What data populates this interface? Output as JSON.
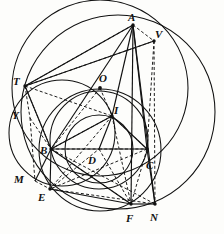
{
  "figure": {
    "kind": "euclidean-geometry-diagram",
    "background_color": "#fdfdfb",
    "stroke_color": "#111111",
    "dot_color": "#111111"
  },
  "labels": [
    {
      "id": "A",
      "text": "A",
      "x": 128,
      "y": 12
    },
    {
      "id": "V",
      "text": "V",
      "x": 155,
      "y": 29
    },
    {
      "id": "T",
      "text": "T",
      "x": 13,
      "y": 76
    },
    {
      "id": "O",
      "text": "O",
      "x": 99,
      "y": 73
    },
    {
      "id": "Y",
      "text": "Y",
      "x": 12,
      "y": 110
    },
    {
      "id": "I",
      "text": "I",
      "x": 114,
      "y": 105
    },
    {
      "id": "B",
      "text": "B",
      "x": 40,
      "y": 145
    },
    {
      "id": "D",
      "text": "D",
      "x": 88,
      "y": 155
    },
    {
      "id": "C",
      "text": "C",
      "x": 146,
      "y": 160
    },
    {
      "id": "M",
      "text": "M",
      "x": 14,
      "y": 174
    },
    {
      "id": "E",
      "text": "E",
      "x": 38,
      "y": 192
    },
    {
      "id": "F",
      "text": "F",
      "x": 126,
      "y": 213
    },
    {
      "id": "N",
      "text": "N",
      "x": 150,
      "y": 212
    }
  ],
  "points": [
    {
      "id": "A",
      "x": 133,
      "y": 25,
      "marked": true
    },
    {
      "id": "V",
      "x": 154,
      "y": 41,
      "marked": true
    },
    {
      "id": "T",
      "x": 25,
      "y": 86,
      "marked": true
    },
    {
      "id": "O",
      "x": 100,
      "y": 88,
      "marked": true
    },
    {
      "id": "Y",
      "x": 30,
      "y": 118,
      "marked": false
    },
    {
      "id": "I",
      "x": 112,
      "y": 116,
      "marked": true
    },
    {
      "id": "B",
      "x": 51,
      "y": 149,
      "marked": true
    },
    {
      "id": "D",
      "x": 99,
      "y": 149,
      "marked": false
    },
    {
      "id": "C",
      "x": 147,
      "y": 149,
      "marked": true
    },
    {
      "id": "M",
      "x": 35,
      "y": 181,
      "marked": false
    },
    {
      "id": "E",
      "x": 50,
      "y": 189,
      "marked": true
    },
    {
      "id": "F",
      "x": 131,
      "y": 204,
      "marked": true
    },
    {
      "id": "N",
      "x": 155,
      "y": 204,
      "marked": true
    }
  ],
  "circles": [
    {
      "id": "circumcircle-ABC",
      "cx": 100,
      "cy": 88,
      "r": 88,
      "style": "solid"
    },
    {
      "id": "circle-right-large",
      "cx": 118,
      "cy": 112,
      "r": 97,
      "style": "solid"
    },
    {
      "id": "circle-left-TBME",
      "cx": 62,
      "cy": 133,
      "r": 53,
      "style": "solid"
    },
    {
      "id": "circle-BIC-mid",
      "cx": 99,
      "cy": 140,
      "r": 49,
      "style": "solid"
    },
    {
      "id": "incircle-BDC",
      "cx": 99,
      "cy": 149,
      "r": 34,
      "style": "solid"
    },
    {
      "id": "circle-lower-EFN",
      "cx": 100,
      "cy": 150,
      "r": 61,
      "style": "solid"
    }
  ],
  "solid_segments": [
    [
      "A",
      "B"
    ],
    [
      "A",
      "C"
    ],
    [
      "A",
      "I"
    ],
    [
      "A",
      "F"
    ],
    [
      "B",
      "C"
    ],
    [
      "B",
      "E"
    ],
    [
      "B",
      "M"
    ],
    [
      "B",
      "T"
    ],
    [
      "B",
      "I"
    ],
    [
      "B",
      "F"
    ],
    [
      "C",
      "N"
    ],
    [
      "C",
      "I"
    ],
    [
      "T",
      "A"
    ],
    [
      "T",
      "V"
    ],
    [
      "I",
      "D"
    ],
    [
      "E",
      "F"
    ],
    [
      "F",
      "N"
    ],
    [
      "A",
      "N"
    ]
  ],
  "dashed_segments": [
    [
      "A",
      "T"
    ],
    [
      "A",
      "V"
    ],
    [
      "T",
      "V"
    ],
    [
      "T",
      "Y"
    ],
    [
      "T",
      "B"
    ],
    [
      "V",
      "N"
    ],
    [
      "V",
      "C"
    ],
    [
      "Y",
      "M"
    ],
    [
      "Y",
      "B"
    ],
    [
      "M",
      "E"
    ],
    [
      "B",
      "D"
    ],
    [
      "B",
      "F"
    ],
    [
      "B",
      "N"
    ],
    [
      "C",
      "E"
    ],
    [
      "C",
      "F"
    ],
    [
      "I",
      "E"
    ],
    [
      "I",
      "F"
    ],
    [
      "I",
      "C"
    ],
    [
      "I",
      "B"
    ],
    [
      "E",
      "N"
    ],
    [
      "E",
      "D"
    ],
    [
      "D",
      "F"
    ],
    [
      "D",
      "C"
    ],
    [
      "T",
      "I"
    ],
    [
      "O",
      "B"
    ],
    [
      "O",
      "I"
    ]
  ]
}
